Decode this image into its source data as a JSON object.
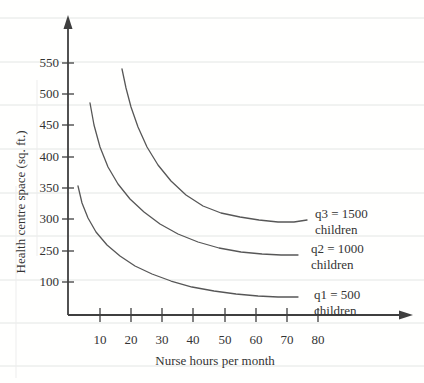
{
  "figure": {
    "y_axis_title": "Health centre space (sq. ft.)",
    "x_axis_title": "Nurse hours per month"
  },
  "chart_data": {
    "type": "line",
    "title": "",
    "xlabel": "Nurse hours per month",
    "ylabel": "Health centre space (sq. ft.)",
    "x_tick_labels": [
      "10",
      "20",
      "30",
      "40",
      "50",
      "60",
      "70",
      "80"
    ],
    "y_tick_labels": [
      "550",
      "500",
      "450",
      "400",
      "350",
      "300",
      "250",
      "100"
    ],
    "y_axis_note": "y tick labels as printed are non-uniform: sequence jumps from 250 to 100",
    "grid": "faint horizontal ruled lines across page (scan artifact)",
    "legend_position": "labels at right end of each curve",
    "series": [
      {
        "name": "q1 = 500 children",
        "x": [
          3,
          5,
          8,
          11,
          14,
          18,
          23,
          28,
          34,
          41,
          49,
          57,
          66,
          74
        ],
        "y": [
          350,
          318,
          290,
          262,
          235,
          205,
          178,
          152,
          130,
          114,
          103,
          96,
          92,
          90
        ]
      },
      {
        "name": "q2 = 1000 children",
        "x": [
          7,
          9,
          12,
          16,
          20,
          25,
          31,
          38,
          45,
          53,
          63,
          74
        ],
        "y": [
          485,
          430,
          385,
          348,
          318,
          295,
          278,
          265,
          256,
          250,
          247,
          245
        ]
      },
      {
        "name": "q3 = 1500 children",
        "x": [
          17,
          19,
          22,
          26,
          30,
          35,
          41,
          47,
          54,
          61,
          68,
          77
        ],
        "y": [
          540,
          490,
          445,
          408,
          378,
          352,
          333,
          319,
          309,
          303,
          300,
          299
        ]
      }
    ]
  },
  "curve_labels": [
    {
      "id": "q3",
      "line1": "q3 = 1500",
      "line2": "children",
      "x": 315,
      "y": 206
    },
    {
      "id": "q2",
      "line1": "q2 = 1000",
      "line2": "children",
      "x": 311,
      "y": 241
    },
    {
      "id": "q1",
      "line1": "q1 = 500",
      "line2": "children",
      "x": 314,
      "y": 287
    }
  ],
  "geometry": {
    "width": 424,
    "height": 383,
    "colors": {
      "axis": "#3f3f3f",
      "curve": "#575757",
      "text": "#343434",
      "ruled_line": "#e3e6e4",
      "artifact": "#ededed"
    },
    "axes": {
      "origin_x": 68,
      "origin_y": 315,
      "y_top": 26,
      "x_right": 401,
      "y_arrow_tip": 15,
      "x_arrow_tip": 413
    },
    "ruled_lines_y": [
      18,
      62,
      105,
      149,
      193,
      236,
      280,
      323,
      366
    ],
    "artifact_vlines": [
      {
        "x": 16,
        "y1": 186,
        "y2": 378
      },
      {
        "x": 37,
        "y1": 80,
        "y2": 256
      }
    ],
    "y_ticks": [
      {
        "label": "550",
        "y": 63
      },
      {
        "label": "500",
        "y": 94
      },
      {
        "label": "450",
        "y": 125
      },
      {
        "label": "400",
        "y": 157
      },
      {
        "label": "350",
        "y": 188
      },
      {
        "label": "300",
        "y": 219
      },
      {
        "label": "250",
        "y": 251
      },
      {
        "label": "100",
        "y": 282
      }
    ],
    "x_ticks": [
      {
        "label": "10",
        "x": 100
      },
      {
        "label": "20",
        "x": 131
      },
      {
        "label": "30",
        "x": 162
      },
      {
        "label": "40",
        "x": 193
      },
      {
        "label": "50",
        "x": 225
      },
      {
        "label": "60",
        "x": 256
      },
      {
        "label": "70",
        "x": 287
      },
      {
        "label": "80",
        "x": 318
      }
    ],
    "curves": [
      {
        "id": "q1",
        "points": [
          [
            78,
            186
          ],
          [
            82,
            203
          ],
          [
            88,
            218
          ],
          [
            96,
            232
          ],
          [
            107,
            245
          ],
          [
            120,
            256
          ],
          [
            135,
            266
          ],
          [
            152,
            274
          ],
          [
            171,
            281
          ],
          [
            192,
            287
          ],
          [
            214,
            291
          ],
          [
            236,
            294
          ],
          [
            258,
            296
          ],
          [
            278,
            297
          ],
          [
            298,
            297
          ]
        ]
      },
      {
        "id": "q2",
        "points": [
          [
            90,
            103
          ],
          [
            94,
            125
          ],
          [
            100,
            147
          ],
          [
            108,
            167
          ],
          [
            118,
            184
          ],
          [
            130,
            199
          ],
          [
            144,
            212
          ],
          [
            160,
            224
          ],
          [
            178,
            234
          ],
          [
            198,
            242
          ],
          [
            219,
            248
          ],
          [
            241,
            252
          ],
          [
            262,
            254
          ],
          [
            281,
            255
          ],
          [
            298,
            255
          ]
        ]
      },
      {
        "id": "q3",
        "points": [
          [
            122,
            69
          ],
          [
            126,
            88
          ],
          [
            131,
            107
          ],
          [
            138,
            127
          ],
          [
            147,
            147
          ],
          [
            158,
            165
          ],
          [
            171,
            181
          ],
          [
            186,
            195
          ],
          [
            203,
            206
          ],
          [
            221,
            213
          ],
          [
            240,
            217
          ],
          [
            259,
            220
          ],
          [
            278,
            222
          ],
          [
            294,
            222
          ],
          [
            307,
            220
          ]
        ]
      }
    ]
  }
}
